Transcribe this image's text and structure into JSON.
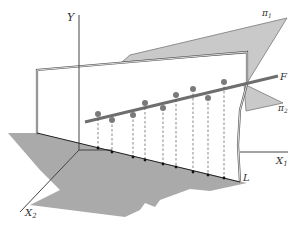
{
  "diagram": {
    "type": "3d-geometric-projection",
    "labels": {
      "y_axis": "Y",
      "x1_axis": "X",
      "x1_sub": "1",
      "x2_axis": "X",
      "x2_sub": "2",
      "line_f": "F",
      "line_l": "L",
      "plane_1": "π",
      "plane_1_sub": "1",
      "plane_2": "π",
      "plane_2_sub": "2"
    },
    "colors": {
      "plane_fill": "#a9a9a9",
      "upper_plane_fill": "#c8c8c8",
      "line_f": "#6e6e6e",
      "dot": "#7a7a7a",
      "axis": "#444444"
    },
    "points": [
      {
        "x": 98,
        "y": 114,
        "px": 98,
        "py": 148
      },
      {
        "x": 112,
        "y": 120,
        "px": 112,
        "py": 152
      },
      {
        "x": 133,
        "y": 115,
        "px": 133,
        "py": 157
      },
      {
        "x": 145,
        "y": 103,
        "px": 145,
        "py": 160
      },
      {
        "x": 163,
        "y": 108,
        "px": 163,
        "py": 164
      },
      {
        "x": 176,
        "y": 95,
        "px": 176,
        "py": 167
      },
      {
        "x": 193,
        "y": 89,
        "px": 193,
        "py": 172
      },
      {
        "x": 208,
        "y": 98,
        "px": 208,
        "py": 175
      },
      {
        "x": 224,
        "y": 82,
        "px": 224,
        "py": 178
      }
    ]
  }
}
